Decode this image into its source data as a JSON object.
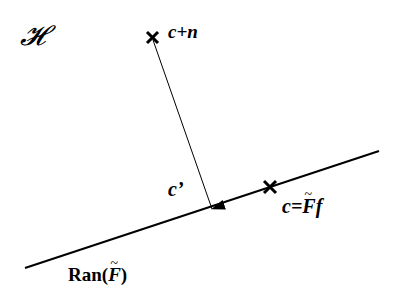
{
  "diagram": {
    "space_label": "𝓗",
    "points": {
      "top": {
        "label": "c+n",
        "x": 152,
        "y": 37
      },
      "projection_on_line": {
        "label_prefix": "c=",
        "label_F": "F",
        "label_suffix": "f",
        "x": 270,
        "y": 187
      }
    },
    "arrow": {
      "label": "c’",
      "from": [
        152,
        37
      ],
      "to": [
        212,
        209
      ]
    },
    "line": {
      "label_prefix": "Ran(",
      "label_F": "F",
      "label_suffix": ")",
      "from": [
        25,
        268
      ],
      "to": [
        379,
        151
      ]
    },
    "colors": {
      "ink": "#000000",
      "background": "#ffffff"
    }
  }
}
